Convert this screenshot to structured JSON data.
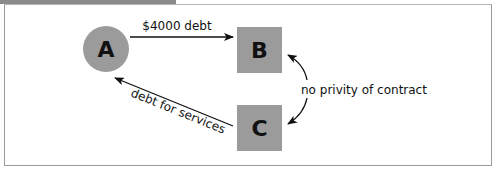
{
  "diagram": {
    "nodes": [
      {
        "id": "A",
        "label": "A",
        "shape": "circle"
      },
      {
        "id": "B",
        "label": "B",
        "shape": "square"
      },
      {
        "id": "C",
        "label": "C",
        "shape": "square"
      }
    ],
    "edges": [
      {
        "from": "A",
        "to": "B",
        "label": "$4000 debt"
      },
      {
        "from": "C",
        "to": "A",
        "label": "debt for services"
      },
      {
        "between": [
          "B",
          "C"
        ],
        "label": "no privity of contract",
        "bidirectional": true
      }
    ]
  },
  "colors": {
    "node_fill": "#9b9b9b",
    "line": "#111111",
    "frame": "#9a9a9a",
    "tab": "#8a8a8a"
  }
}
